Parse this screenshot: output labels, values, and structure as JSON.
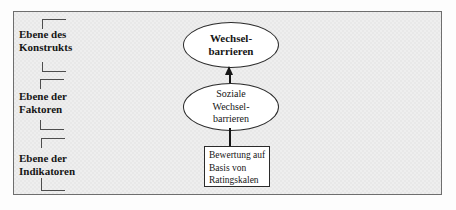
{
  "diagram": {
    "levels": [
      {
        "lines": [
          "Ebene des",
          "Konstrukts"
        ]
      },
      {
        "lines": [
          "Ebene der",
          "Faktoren"
        ]
      },
      {
        "lines": [
          "Ebene der",
          "Indikatoren"
        ]
      }
    ],
    "construct_node": {
      "shape": "ellipse",
      "lines": [
        "Wechsel-",
        "barrieren"
      ]
    },
    "factor_node": {
      "shape": "ellipse",
      "lines": [
        "Soziale",
        "Wechsel-",
        "barrieren"
      ]
    },
    "indicator_node": {
      "shape": "rect",
      "lines": [
        "Bewertung auf",
        "Basis von",
        "Ratingskalen"
      ]
    },
    "colors": {
      "page_bg": "#fdfdfd",
      "frame_bg": "#ebebeb",
      "frame_border": "#6e6e6e",
      "node_fill": "#ffffff",
      "node_border": "#2b2b2b",
      "bracket": "#4d4d4d",
      "line": "#161616",
      "text": "#161616"
    }
  }
}
